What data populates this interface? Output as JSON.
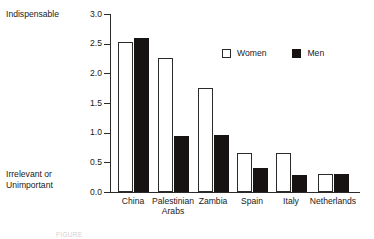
{
  "chart_data": {
    "type": "bar",
    "title": "",
    "xlabel": "",
    "ylabel": "",
    "ylim": [
      0.0,
      3.0
    ],
    "grid": false,
    "legend_position": "top-right",
    "categories": [
      "China",
      "Palestinian\nArabs",
      "Zambia",
      "Spain",
      "Italy",
      "Netherlands"
    ],
    "series": [
      {
        "name": "Women",
        "values": [
          2.52,
          2.26,
          1.76,
          0.65,
          0.66,
          0.3
        ]
      },
      {
        "name": "Men",
        "values": [
          2.6,
          0.95,
          0.96,
          0.4,
          0.28,
          0.3
        ]
      }
    ],
    "y_ticks": [
      "0.0",
      "0.5",
      "1.0",
      "1.5",
      "2.0",
      "2.5",
      "3.0"
    ],
    "y_tick_values": [
      0.0,
      0.5,
      1.0,
      1.5,
      2.0,
      2.5,
      3.0
    ],
    "axis_annotation_top": "Indispensable",
    "axis_annotation_bottom": "Irrelevant or\nUnimportant",
    "colors": {
      "women": "#ffffff",
      "women_border": "#2b2b2b",
      "men": "#171313",
      "axis": "#2a2a2a",
      "text": "#1a1a1a",
      "background": "#ffffff"
    }
  },
  "legend": {
    "items": [
      {
        "label": "Women",
        "style": "women"
      },
      {
        "label": "Men",
        "style": "men"
      }
    ]
  },
  "caption_remnant": "FIGURE"
}
